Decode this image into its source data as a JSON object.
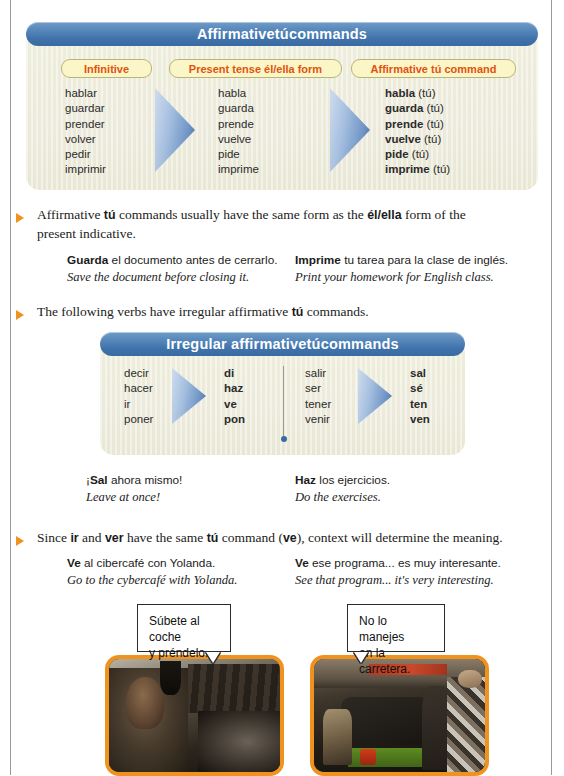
{
  "table1": {
    "title_pre": "Affirmative ",
    "title_em": "tú",
    "title_post": " commands",
    "headers": [
      "Infinitive",
      "Present tense él/ella form",
      "Affirmative tú command"
    ],
    "infinitives": [
      "hablar",
      "guardar",
      "prender",
      "volver",
      "pedir",
      "imprimir"
    ],
    "present": [
      "habla",
      "guarda",
      "prende",
      "vuelve",
      "pide",
      "imprime"
    ],
    "commands": [
      "habla",
      "guarda",
      "prende",
      "vuelve",
      "pide",
      "imprime"
    ],
    "command_suffix": "(tú)"
  },
  "bullet1": {
    "text_1": "Affirmative ",
    "bold_1": "tú",
    "text_2": " commands usually have the same form as the ",
    "bold_2": "él/ella",
    "text_3": " form of the present indicative."
  },
  "examples1": [
    {
      "sp_bold": "Guarda",
      "sp_rest": " el documento antes de cerrarlo.",
      "en": "Save the document before closing it."
    },
    {
      "sp_bold": "Imprime",
      "sp_rest": " tu tarea para la clase de inglés.",
      "en": "Print your homework for English class."
    }
  ],
  "bullet2": {
    "text_1": "The following verbs have irregular affirmative ",
    "bold_1": "tú",
    "text_2": " commands."
  },
  "table2": {
    "title_pre": "Irregular affirmative ",
    "title_em": "tú",
    "title_post": " commands",
    "left_infinitives": [
      "decir",
      "hacer",
      "ir",
      "poner"
    ],
    "left_commands": [
      "di",
      "haz",
      "ve",
      "pon"
    ],
    "right_infinitives": [
      "salir",
      "ser",
      "tener",
      "venir"
    ],
    "right_commands": [
      "sal",
      "sé",
      "ten",
      "ven"
    ]
  },
  "examples2": [
    {
      "sp_pre": "¡",
      "sp_bold": "Sal",
      "sp_rest": " ahora mismo!",
      "en": "Leave at once!"
    },
    {
      "sp_pre": "",
      "sp_bold": "Haz",
      "sp_rest": " los ejercicios.",
      "en": "Do the exercises."
    }
  ],
  "bullet3": {
    "text_1": "Since ",
    "bold_1": "ir",
    "text_2": " and ",
    "bold_2": "ver",
    "text_3": " have the same ",
    "bold_3": "tú",
    "text_4": " command (",
    "bold_4": "ve",
    "text_5": "), context will determine the meaning."
  },
  "examples3": [
    {
      "sp_bold": "Ve",
      "sp_rest": " al cibercafé con Yolanda.",
      "en": "Go to the cybercafé with Yolanda."
    },
    {
      "sp_bold": "Ve",
      "sp_rest": " ese programa... es muy interesante.",
      "en": "See that program... it's very interesting."
    }
  ],
  "bubbles": [
    {
      "line1": "Súbete al coche",
      "line2": "y préndelo."
    },
    {
      "line1": "No lo manejes",
      "line2": "en la carretera."
    }
  ],
  "photos": [
    {
      "alt": "mechanic-workbench-photo"
    },
    {
      "alt": "garage-green-car-photo"
    }
  ],
  "colors": {
    "banner_blue": "#3f72ab",
    "panel_cream": "#eceadb",
    "header_text": "#e2520f",
    "header_fill": "#fbf6c8",
    "bullet_orange": "#f0921e",
    "photo_border": "#f0921e"
  }
}
